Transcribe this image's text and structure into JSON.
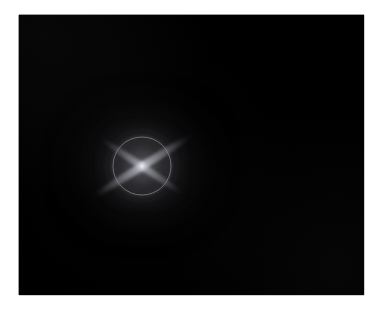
{
  "page": {
    "background_color": "#ffffff",
    "width": 378,
    "height": 309
  },
  "photo": {
    "name": "star-diffraction-photograph",
    "background_color": "#000000",
    "border_color": "#9d9d9d",
    "frame": {
      "left": 19,
      "top": 15,
      "width": 345,
      "height": 280
    },
    "faint_mark_text": "····"
  },
  "subject": {
    "label": "point-light-source",
    "center_x": 142,
    "center_y": 166,
    "core_color": "#fcfcfc",
    "glow_color": "#b0b0b8",
    "halo": {
      "label": "diffraction-halo-ring",
      "radius_px": 28,
      "color": "#bec6c6"
    },
    "spikes": {
      "label": "diffraction-spikes",
      "count": 4,
      "pattern": "crossed-x",
      "angles_deg": [
        -32,
        34,
        148,
        214
      ],
      "primary_length_px": 116,
      "secondary_length_px": 100,
      "color": "#d6d6de"
    },
    "bloom": {
      "label": "lens-bloom",
      "outer_radius_px": 95,
      "inner_radius_px": 46,
      "color": "#96969e"
    }
  }
}
